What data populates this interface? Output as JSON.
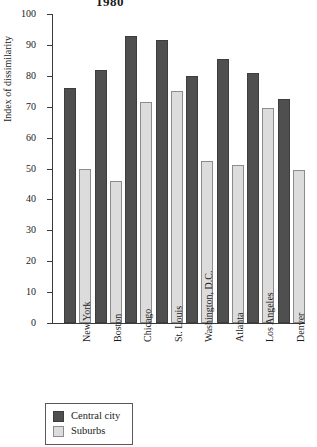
{
  "chart_data": {
    "type": "bar",
    "title": "1980",
    "xlabel": "",
    "ylabel": "Index of dissimilarity",
    "ylim": [
      0,
      100
    ],
    "ytick_step": 10,
    "yticks": [
      0,
      10,
      20,
      30,
      40,
      50,
      60,
      70,
      80,
      90,
      100
    ],
    "grid": false,
    "legend_position": "bottom-left",
    "categories": [
      "New York",
      "Boston",
      "Chicago",
      "St. Louis",
      "Washington, D.C.",
      "Atlanta",
      "Los Angeles",
      "Denver"
    ],
    "series": [
      {
        "name": "Central city",
        "color": "#4f4f4f",
        "values": [
          76,
          82,
          93,
          91.5,
          80,
          85.5,
          81,
          72.5
        ]
      },
      {
        "name": "Suburbs",
        "color": "#dcdcdc",
        "values": [
          50,
          46,
          71.5,
          75,
          52.5,
          51,
          69.5,
          49.5
        ]
      }
    ]
  },
  "legend": {
    "items": [
      {
        "label": "Central city",
        "swatch": "central"
      },
      {
        "label": "Suburbs",
        "swatch": "suburb"
      }
    ]
  }
}
